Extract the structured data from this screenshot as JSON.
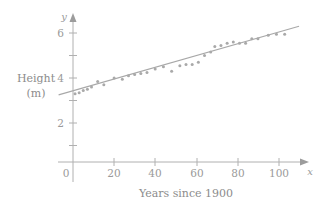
{
  "chart_data": {
    "type": "scatter",
    "title": "",
    "subtitle": "",
    "xlabel": "Years since 1900",
    "ylabel": "Height (m)",
    "ylabel_lines": [
      "Height",
      "(m)"
    ],
    "x_axis_variable": "x",
    "y_axis_variable": "y",
    "xlim": [
      -8,
      112
    ],
    "ylim": [
      -1.2,
      6.9
    ],
    "xticks": [
      0,
      20,
      40,
      60,
      80,
      100
    ],
    "xtick_labels": [
      "0",
      "20",
      "40",
      "60",
      "80",
      "100"
    ],
    "yticks": [
      1,
      2,
      3,
      4,
      5,
      6
    ],
    "ytick_labels": [
      "",
      "2",
      "",
      "4",
      "",
      "6"
    ],
    "y_minor_ticks_below_axis": [
      -1
    ],
    "grid": false,
    "legend": null,
    "origin_label": "0",
    "points": [
      {
        "x": 1,
        "y": 3.3
      },
      {
        "x": 3,
        "y": 3.35
      },
      {
        "x": 5,
        "y": 3.45
      },
      {
        "x": 7,
        "y": 3.5
      },
      {
        "x": 9,
        "y": 3.6
      },
      {
        "x": 12,
        "y": 3.85
      },
      {
        "x": 15,
        "y": 3.7
      },
      {
        "x": 20,
        "y": 4.0
      },
      {
        "x": 24,
        "y": 3.95
      },
      {
        "x": 27,
        "y": 4.1
      },
      {
        "x": 30,
        "y": 4.15
      },
      {
        "x": 33,
        "y": 4.2
      },
      {
        "x": 36,
        "y": 4.25
      },
      {
        "x": 40,
        "y": 4.4
      },
      {
        "x": 44,
        "y": 4.5
      },
      {
        "x": 48,
        "y": 4.3
      },
      {
        "x": 52,
        "y": 4.55
      },
      {
        "x": 55,
        "y": 4.6
      },
      {
        "x": 58,
        "y": 4.6
      },
      {
        "x": 61,
        "y": 4.7
      },
      {
        "x": 64,
        "y": 5.0
      },
      {
        "x": 67,
        "y": 5.15
      },
      {
        "x": 69,
        "y": 5.4
      },
      {
        "x": 72,
        "y": 5.45
      },
      {
        "x": 75,
        "y": 5.55
      },
      {
        "x": 78,
        "y": 5.6
      },
      {
        "x": 81,
        "y": 5.55
      },
      {
        "x": 84,
        "y": 5.55
      },
      {
        "x": 87,
        "y": 5.75
      },
      {
        "x": 90,
        "y": 5.75
      },
      {
        "x": 95,
        "y": 5.9
      },
      {
        "x": 99,
        "y": 5.95
      },
      {
        "x": 103,
        "y": 5.95
      }
    ],
    "trend_line": {
      "x_start": -7,
      "y_start": 3.25,
      "x_end": 110,
      "y_end": 6.3,
      "slope": 0.0261,
      "intercept": 3.43
    },
    "colors": {
      "point": "#a9a9a9",
      "line": "#a8a8a8",
      "axis": "#b0b0b0",
      "text": "#9a9a9a",
      "background": "#ffffff"
    }
  }
}
